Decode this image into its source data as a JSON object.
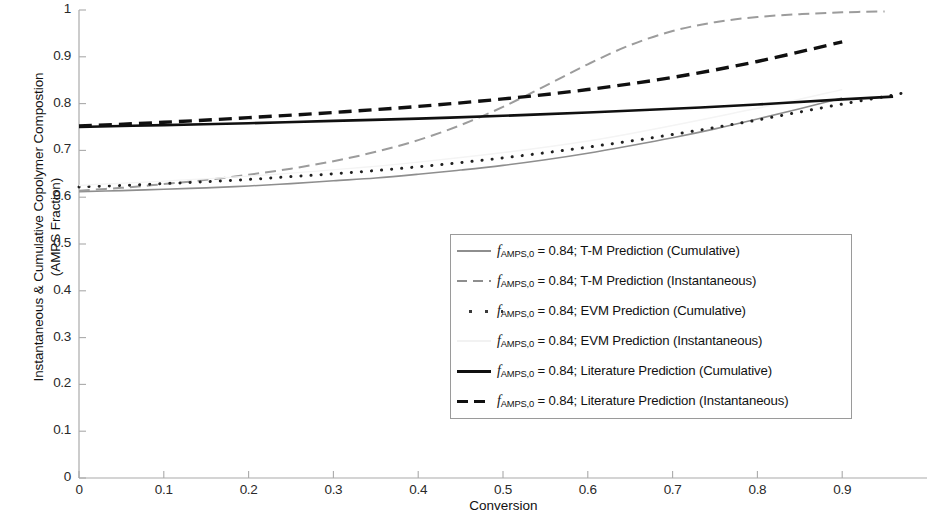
{
  "chart_data": {
    "type": "line",
    "title": "",
    "xlabel": "Conversion",
    "ylabel": "Instantaneous & Cumulative Copolymer Compostion\n(AMPS Fraction)",
    "xlim": [
      0,
      1
    ],
    "ylim": [
      0,
      1
    ],
    "grid": false,
    "legend_position": "center-right",
    "xticks": [
      "0",
      "0.1",
      "0.2",
      "0.3",
      "0.4",
      "0.5",
      "0.6",
      "0.7",
      "0.8",
      "0.9"
    ],
    "xtick_values": [
      0,
      0.1,
      0.2,
      0.3,
      0.4,
      0.5,
      0.6,
      0.7,
      0.8,
      0.9
    ],
    "yticks": [
      "0",
      "0.1",
      "0.2",
      "0.3",
      "0.4",
      "0.5",
      "0.6",
      "0.7",
      "0.8",
      "0.9",
      "1"
    ],
    "ytick_values": [
      0,
      0.1,
      0.2,
      0.3,
      0.4,
      0.5,
      0.6,
      0.7,
      0.8,
      0.9,
      1.0
    ],
    "series": [
      {
        "name": "f_AMPS,0 = 0.84; T-M Prediction (Cumulative)",
        "style": "solid",
        "color": "#8e8e8e",
        "width": 1.6,
        "x": [
          0.0,
          0.05,
          0.1,
          0.15,
          0.2,
          0.25,
          0.3,
          0.35,
          0.4,
          0.45,
          0.5,
          0.55,
          0.6,
          0.65,
          0.7,
          0.75,
          0.8,
          0.85,
          0.9
        ],
        "y": [
          0.612,
          0.614,
          0.617,
          0.62,
          0.624,
          0.629,
          0.635,
          0.641,
          0.649,
          0.658,
          0.668,
          0.68,
          0.694,
          0.71,
          0.727,
          0.746,
          0.767,
          0.789,
          0.812
        ]
      },
      {
        "name": "f_AMPS,0 = 0.84; T-M Prediction (Instantaneous)",
        "style": "dashed",
        "color": "#9c9c9c",
        "width": 2.0,
        "x": [
          0.0,
          0.05,
          0.1,
          0.15,
          0.2,
          0.25,
          0.3,
          0.35,
          0.4,
          0.45,
          0.5,
          0.55,
          0.6,
          0.65,
          0.7,
          0.75,
          0.8,
          0.85,
          0.9,
          0.95
        ],
        "y": [
          0.614,
          0.62,
          0.628,
          0.637,
          0.648,
          0.661,
          0.677,
          0.697,
          0.722,
          0.754,
          0.793,
          0.838,
          0.884,
          0.925,
          0.955,
          0.974,
          0.985,
          0.991,
          0.995,
          0.997
        ]
      },
      {
        "name": "f_AMPS,0 = 0.84; EVM Prediction (Cumulative)",
        "style": "dotted",
        "color": "#1f1f1f",
        "width": 3.0,
        "x": [
          0.0,
          0.05,
          0.1,
          0.15,
          0.2,
          0.25,
          0.3,
          0.35,
          0.4,
          0.45,
          0.5,
          0.55,
          0.6,
          0.65,
          0.7,
          0.75,
          0.8,
          0.85,
          0.9,
          0.95,
          0.97
        ],
        "y": [
          0.622,
          0.625,
          0.629,
          0.633,
          0.638,
          0.644,
          0.65,
          0.657,
          0.665,
          0.674,
          0.684,
          0.695,
          0.707,
          0.72,
          0.734,
          0.749,
          0.765,
          0.782,
          0.799,
          0.815,
          0.822
        ]
      },
      {
        "name": "f_AMPS,0 = 0.84; EVM Prediction (Instantaneous)",
        "style": "solid",
        "color": "#f4f4f4",
        "width": 1.4,
        "x": [
          0.0,
          0.2,
          0.4,
          0.6,
          0.8,
          0.9
        ],
        "y": [
          0.625,
          0.645,
          0.675,
          0.72,
          0.79,
          0.83
        ]
      },
      {
        "name": "f_AMPS,0 = 0.84; Literature Prediction (Cumulative)",
        "style": "solid",
        "color": "#101010",
        "width": 2.6,
        "x": [
          0.0,
          0.1,
          0.2,
          0.3,
          0.4,
          0.5,
          0.6,
          0.7,
          0.8,
          0.9,
          0.96
        ],
        "y": [
          0.75,
          0.754,
          0.758,
          0.763,
          0.768,
          0.774,
          0.781,
          0.789,
          0.798,
          0.809,
          0.815
        ]
      },
      {
        "name": "f_AMPS,0 = 0.84; Literature Prediction (Instantaneous)",
        "style": "dashed",
        "color": "#101010",
        "width": 3.4,
        "x": [
          0.0,
          0.1,
          0.2,
          0.3,
          0.4,
          0.5,
          0.6,
          0.7,
          0.8,
          0.9
        ],
        "y": [
          0.752,
          0.76,
          0.77,
          0.781,
          0.794,
          0.81,
          0.83,
          0.856,
          0.89,
          0.932
        ]
      }
    ]
  },
  "legend": {
    "entries": [
      {
        "prefix": "f",
        "sub": "AMPS,0",
        "rest": " = 0.84; T-M Prediction (Cumulative)",
        "key": "k-solid-gray"
      },
      {
        "prefix": "f",
        "sub": "AMPS,0",
        "rest": " = 0.84; T-M Prediction (Instantaneous)",
        "key": "k-dash-gray"
      },
      {
        "prefix": "f",
        "sub": "AMPS,0",
        "rest": " = 0.84; EVM Prediction (Cumulative)",
        "key": "k-dot-gray"
      },
      {
        "prefix": "f",
        "sub": "AMPS,0",
        "rest": " = 0.84; EVM Prediction (Instantaneous)",
        "key": "k-solid-faint"
      },
      {
        "prefix": "f",
        "sub": "AMPS,0",
        "rest": " = 0.84; Literature Prediction (Cumulative)",
        "key": "k-solid-black"
      },
      {
        "prefix": "f",
        "sub": "AMPS,0",
        "rest": " = 0.84; Literature Prediction (Instantaneous)",
        "key": "k-dash-black"
      }
    ]
  },
  "axis_label_x": "Conversion",
  "axis_label_y": "Instantaneous & Cumulative Copolymer Compostion\n(AMPS Fraction)"
}
